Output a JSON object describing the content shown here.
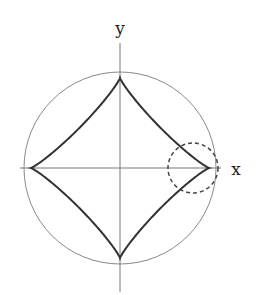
{
  "diagram": {
    "type": "hypocycloid-in-circle",
    "axis_labels": {
      "x": "x",
      "y": "y"
    },
    "center": [
      120,
      168
    ],
    "outer_circle": {
      "radius": 96,
      "stroke": "#888888"
    },
    "curve": {
      "rx": 89,
      "ry": 90,
      "exponent": 0.87,
      "stroke": "#333333",
      "cusps": 4
    },
    "highlight_circle": {
      "center": [
        193,
        168
      ],
      "radius": 25,
      "style": "dashed",
      "stroke": "#444444"
    },
    "x_axis": {
      "from": 20,
      "to": 221
    },
    "y_axis": {
      "from": 43,
      "to": 292
    }
  }
}
